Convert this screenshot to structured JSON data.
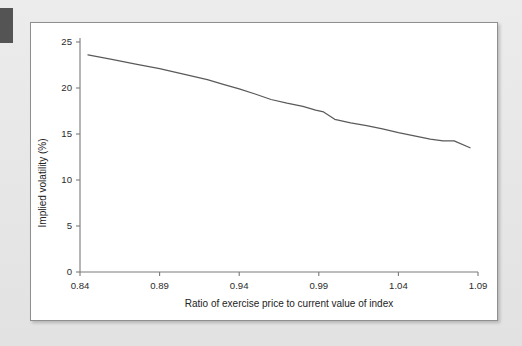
{
  "page": {
    "background_color": "#e9e9e9",
    "tab_marker_color": "#545454",
    "card_background": "#ffffff",
    "card_border_color": "#8f8f8f"
  },
  "chart_data": {
    "type": "line",
    "title": "",
    "subtitle": "",
    "xlabel": "Ratio of exercise price to current value of index",
    "ylabel": "Implied volatility (%)",
    "xlim": [
      0.84,
      1.09
    ],
    "ylim": [
      0,
      25
    ],
    "grid": false,
    "legend": null,
    "legend_position": "none",
    "line_color": "#5a5a5a",
    "xticks": [
      0.84,
      0.89,
      0.94,
      0.99,
      1.04,
      1.09
    ],
    "xtick_labels": [
      "0.84",
      "0.89",
      "0.94",
      "0.99",
      "1.04",
      "1.09"
    ],
    "yticks": [
      0,
      5,
      10,
      15,
      20,
      25
    ],
    "ytick_labels": [
      "0",
      "5",
      "10",
      "15",
      "20",
      "25"
    ],
    "series": [
      {
        "name": "Implied volatility",
        "x": [
          0.845,
          0.86,
          0.875,
          0.89,
          0.905,
          0.92,
          0.93,
          0.94,
          0.95,
          0.96,
          0.97,
          0.98,
          0.988,
          0.993,
          1.0,
          1.01,
          1.02,
          1.03,
          1.04,
          1.05,
          1.06,
          1.068,
          1.075,
          1.085
        ],
        "y": [
          23.6,
          23.1,
          22.6,
          22.1,
          21.5,
          20.9,
          20.4,
          19.9,
          19.35,
          18.75,
          18.35,
          18.0,
          17.6,
          17.4,
          16.6,
          16.2,
          15.9,
          15.55,
          15.15,
          14.8,
          14.45,
          14.25,
          14.25,
          13.5
        ]
      }
    ]
  }
}
